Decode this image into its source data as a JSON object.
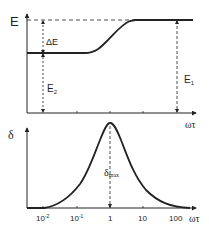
{
  "diagram": {
    "top_panel": {
      "y_axis_label": "E",
      "x_axis_label": "ωτ",
      "labels": {
        "delta_e": "ΔE",
        "e2": "E",
        "e2_sub": "2",
        "e1": "E",
        "e1_sub": "1"
      },
      "curve_description": "Step-like rise from low plateau E2 to high plateau E1 around ωτ ≈ 1"
    },
    "bottom_panel": {
      "y_axis_label": "δ",
      "x_axis_label": "ωτ",
      "peak_label": "δ",
      "peak_label_sub": "max",
      "x_ticks": [
        {
          "base": "10",
          "exp": "-2"
        },
        {
          "base": "10",
          "exp": "-1"
        },
        {
          "base": "1",
          "exp": ""
        },
        {
          "base": "10",
          "exp": ""
        },
        {
          "base": "100",
          "exp": ""
        }
      ],
      "curve_description": "Bell-shaped peak centered at ωτ = 1"
    },
    "colors": {
      "line": "#222222",
      "background": "#ffffff"
    }
  }
}
